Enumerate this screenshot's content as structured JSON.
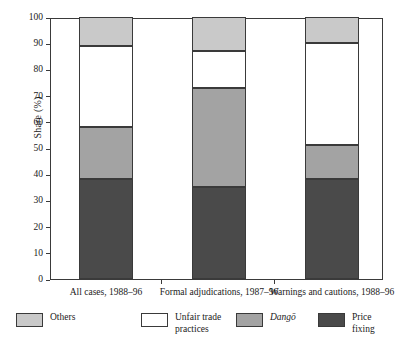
{
  "chart_data": {
    "type": "bar",
    "subtype": "stacked-bar-100",
    "title": "",
    "xlabel": "",
    "ylabel": "Share (%)",
    "ylim": [
      0,
      100
    ],
    "ytick_values": [
      0,
      10,
      20,
      30,
      40,
      50,
      60,
      70,
      80,
      90,
      100
    ],
    "ytick_labels": [
      "0",
      "10",
      "20",
      "30",
      "40",
      "50",
      "60",
      "70",
      "80",
      "90",
      "100"
    ],
    "grid": false,
    "legend_position": "bottom",
    "categories": [
      "All cases, 1988–96",
      "Formal adjudications, 1987–96",
      "Warnings and cautions, 1988–96"
    ],
    "series": [
      {
        "name": "Price fixing",
        "color": "#4a4a4a",
        "values": [
          38,
          35,
          38
        ]
      },
      {
        "name": "Dangō",
        "color": "#a3a3a3",
        "values": [
          20,
          38,
          13
        ]
      },
      {
        "name": "Unfair trade practices",
        "color": "#ffffff",
        "values": [
          31,
          14,
          39
        ]
      },
      {
        "name": "Others",
        "color": "#c9c9c9",
        "values": [
          11,
          13,
          10
        ]
      }
    ],
    "segment_boundaries": [
      {
        "category": "All cases, 1988–96",
        "price_fixing_top": 38,
        "dango_top": 58,
        "unfair_trade_top": 89,
        "others_top": 100
      },
      {
        "category": "Formal adjudications, 1987–96",
        "price_fixing_top": 35,
        "dango_top": 73,
        "unfair_trade_top": 87,
        "others_top": 100
      },
      {
        "category": "Warnings and cautions, 1988–96",
        "price_fixing_top": 38,
        "dango_top": 51,
        "unfair_trade_top": 90,
        "others_top": 100
      }
    ]
  },
  "axis": {
    "y_label": "Share (%)",
    "ticks": [
      {
        "label": "100"
      },
      {
        "label": "90"
      },
      {
        "label": "80"
      },
      {
        "label": "70"
      },
      {
        "label": "60"
      },
      {
        "label": "50"
      },
      {
        "label": "40"
      },
      {
        "label": "30"
      },
      {
        "label": "20"
      },
      {
        "label": "10"
      },
      {
        "label": "0"
      }
    ]
  },
  "x_labels": [
    {
      "text": "All cases, 1988–96"
    },
    {
      "text": "Formal adjudications,\n1987–96"
    },
    {
      "text": "Warnings and\ncautions, 1988–96"
    }
  ],
  "legend": {
    "items": [
      {
        "label": "Others",
        "color": "#c9c9c9",
        "italic": false
      },
      {
        "label": "Unfair trade\npractices",
        "color": "#ffffff",
        "italic": false
      },
      {
        "label": "Dangō",
        "color": "#a3a3a3",
        "italic": true
      },
      {
        "label": "Price\nfixing",
        "color": "#4a4a4a",
        "italic": false
      }
    ]
  },
  "colors": {
    "others": "#c9c9c9",
    "unfair_trade_practices": "#ffffff",
    "dango": "#a3a3a3",
    "price_fixing": "#4a4a4a",
    "axis_line": "#3a3a3a",
    "text": "#1a1a1a",
    "background": "#ffffff"
  }
}
